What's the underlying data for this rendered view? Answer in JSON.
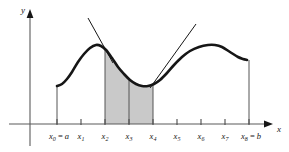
{
  "figure": {
    "type": "calculus-diagram",
    "title": "",
    "background_color": "#ffffff",
    "curve_color": "#161616",
    "tangent_color": "#161616",
    "shade_color": "#c9c9c9",
    "axis_color": "#4a4a4a"
  },
  "axes": {
    "y_label": "y",
    "x_label": "x",
    "x_axis_y_px": 124,
    "y_axis_x_px": 30
  },
  "ticks": [
    {
      "id": "x0",
      "base": "x",
      "sub": "0",
      "equals": " = ",
      "value": "a",
      "x_px": 57
    },
    {
      "id": "x1",
      "base": "x",
      "sub": "1",
      "equals": "",
      "value": "",
      "x_px": 81
    },
    {
      "id": "x2",
      "base": "x",
      "sub": "2",
      "equals": "",
      "value": "",
      "x_px": 105
    },
    {
      "id": "x3",
      "base": "x",
      "sub": "3",
      "equals": "",
      "value": "",
      "x_px": 129
    },
    {
      "id": "x4",
      "base": "x",
      "sub": "4",
      "equals": "",
      "value": "",
      "x_px": 153
    },
    {
      "id": "x5",
      "base": "x",
      "sub": "5",
      "equals": "",
      "value": "",
      "x_px": 177
    },
    {
      "id": "x6",
      "base": "x",
      "sub": "6",
      "equals": "",
      "value": "",
      "x_px": 201
    },
    {
      "id": "x7",
      "base": "x",
      "sub": "7",
      "equals": "",
      "value": "",
      "x_px": 225
    },
    {
      "id": "x8",
      "base": "x",
      "sub": "8",
      "equals": " = ",
      "value": "b",
      "x_px": 249
    }
  ],
  "chart_data": {
    "type": "line",
    "title": "",
    "xlabel": "x",
    "ylabel": "y",
    "grid": false,
    "legend": null,
    "x_tick_labels": [
      "x0 = a",
      "x1",
      "x2",
      "x3",
      "x4",
      "x5",
      "x6",
      "x7",
      "x8 = b"
    ],
    "curve_points_px": [
      [
        57,
        86
      ],
      [
        62,
        84
      ],
      [
        67,
        79
      ],
      [
        72,
        72
      ],
      [
        78,
        62
      ],
      [
        84,
        54
      ],
      [
        90,
        48
      ],
      [
        96,
        45
      ],
      [
        101,
        46
      ],
      [
        106,
        50
      ],
      [
        112,
        58
      ],
      [
        118,
        67
      ],
      [
        124,
        74
      ],
      [
        130,
        80
      ],
      [
        136,
        84
      ],
      [
        142,
        86
      ],
      [
        148,
        86
      ],
      [
        154,
        84
      ],
      [
        160,
        80
      ],
      [
        167,
        73
      ],
      [
        174,
        65
      ],
      [
        182,
        57
      ],
      [
        190,
        51
      ],
      [
        199,
        47
      ],
      [
        208,
        45
      ],
      [
        215,
        45
      ],
      [
        222,
        47
      ],
      [
        230,
        52
      ],
      [
        238,
        57
      ],
      [
        243,
        59
      ],
      [
        247,
        60
      ]
    ],
    "shaded_region": {
      "from_tick": "x2",
      "to_tick": "x4",
      "divider_tick": "x3"
    },
    "tangent_lines": [
      {
        "at_tick": "x2",
        "x1_px": 88,
        "y1_px": 18,
        "x2_px": 113,
        "y2_px": 63
      },
      {
        "at_tick": "x4",
        "x1_px": 150,
        "y1_px": 88,
        "x2_px": 196,
        "y2_px": 24
      }
    ],
    "vertical_ordinates": [
      {
        "at_tick": "x0",
        "y_top_px": 86
      },
      {
        "at_tick": "x8",
        "y_top_px": 60
      }
    ]
  }
}
